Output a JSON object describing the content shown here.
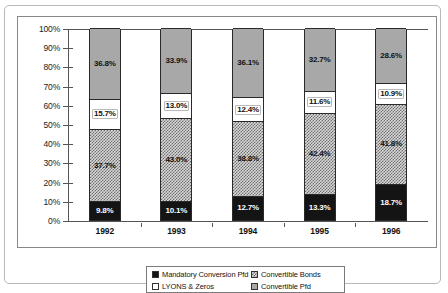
{
  "chart_data": {
    "type": "bar",
    "subtype": "stacked-bar-100-percent",
    "title": "",
    "subtitle": "",
    "xlabel": "",
    "ylabel": "",
    "categories": [
      "1992",
      "1993",
      "1994",
      "1995",
      "1996"
    ],
    "ylim": [
      0,
      100
    ],
    "ytick_labels": [
      "0%",
      "10%",
      "20%",
      "30%",
      "40%",
      "50%",
      "60%",
      "70%",
      "80%",
      "90%",
      "100%"
    ],
    "ytick_values": [
      0,
      10,
      20,
      30,
      40,
      50,
      60,
      70,
      80,
      90,
      100
    ],
    "grid": false,
    "legend_position": "bottom-center",
    "series": [
      {
        "name": "Mandatory Conversion Pfd",
        "fill": "solid-black",
        "color": "#141414",
        "values": [
          9.8,
          10.1,
          12.7,
          13.3,
          18.7
        ],
        "labels": [
          "9.8%",
          "10.1%",
          "12.7%",
          "13.3%",
          "18.7%"
        ],
        "label_style": "on-dark"
      },
      {
        "name": "Convertible Pfd",
        "fill": "checker",
        "color": "#d8d8d8",
        "values": [
          37.7,
          43.0,
          38.8,
          42.4,
          41.8
        ],
        "labels": [
          "37.7%",
          "43.0%",
          "38.8%",
          "42.4%",
          "41.8%"
        ],
        "label_style": "on-light"
      },
      {
        "name": "LYONS & Zeros",
        "fill": "white",
        "color": "#ffffff",
        "values": [
          15.7,
          13.0,
          12.4,
          11.6,
          10.9
        ],
        "labels": [
          "15.7%",
          "13.0%",
          "12.4%",
          "11.6%",
          "10.9%"
        ],
        "label_style": "boxed"
      },
      {
        "name": "Convertible Bonds",
        "fill": "gray",
        "color": "#a8a8a8",
        "values": [
          36.8,
          33.9,
          36.1,
          32.7,
          28.6
        ],
        "labels": [
          "36.8%",
          "33.9%",
          "36.1%",
          "32.7%",
          "28.6%"
        ],
        "label_style": "on-light"
      }
    ],
    "legend_entries": [
      {
        "label": "Mandatory Conversion Pfd",
        "fill": "solid-black",
        "column": "left"
      },
      {
        "label": "LYONS & Zeros",
        "fill": "white",
        "column": "left"
      },
      {
        "label": "Convertible Bonds",
        "fill": "checker",
        "column": "right"
      },
      {
        "label": "Convertible Pfd",
        "fill": "gray",
        "column": "right"
      }
    ]
  }
}
